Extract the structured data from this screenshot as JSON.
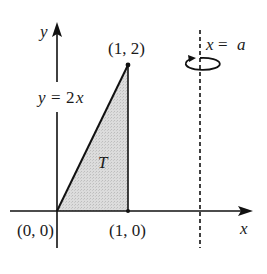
{
  "diagram": {
    "type": "region-of-revolution",
    "axes": {
      "x_label": "x",
      "y_label": "y"
    },
    "region": {
      "label": "T",
      "fill": "#d9d9d9",
      "vertices": [
        [
          0,
          0
        ],
        [
          1,
          0
        ],
        [
          1,
          2
        ]
      ]
    },
    "points": [
      {
        "label": "(0, 0)",
        "coord": [
          0,
          0
        ]
      },
      {
        "label": "(1, 0)",
        "coord": [
          1,
          0
        ]
      },
      {
        "label": "(1, 2)",
        "coord": [
          1,
          2
        ]
      }
    ],
    "curve_label": {
      "lhs": "y",
      "eq": "=",
      "rhs_num": "2",
      "rhs_var": "x"
    },
    "axis_of_rotation": {
      "lhs": "x",
      "eq": "=",
      "rhs": "a",
      "style": "dashed"
    },
    "colors": {
      "stroke": "#111111",
      "fill": "#d9d9d9",
      "background": "#ffffff"
    }
  }
}
